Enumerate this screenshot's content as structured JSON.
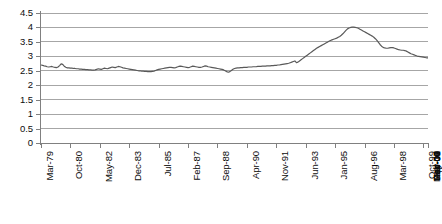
{
  "chart_data": {
    "type": "line",
    "title": "",
    "subtitle": "",
    "xlabel": "",
    "ylabel": "",
    "ylim": [
      0,
      4.5
    ],
    "grid": true,
    "legend": false,
    "legend_position": "none",
    "line_color": "#595959",
    "gridline_color": "#a6a6a6",
    "axis_color": "#808080",
    "text_color": "#0d0d0d",
    "y_ticks": [
      "0",
      "0.5",
      "1",
      "1.5",
      "2",
      "2.5",
      "3",
      "3.5",
      "4",
      "4.5"
    ],
    "y_tick_values": [
      0,
      0.5,
      1,
      1.5,
      2,
      2.5,
      3,
      3.5,
      4,
      4.5
    ],
    "x_tick_labels": [
      "Mar-79",
      "Oct-80",
      "May-82",
      "Dec-83",
      "Jul-85",
      "Feb-87",
      "Sep-88",
      "Apr-90",
      "Nov-91",
      "Jun-93",
      "Jan-95",
      "Aug-96",
      "Mar-98",
      "Oct-99",
      "May-01",
      "Dec-02",
      "Jul-04",
      "Feb-06",
      "Sep-07",
      "Apr-09",
      "Nov-10"
    ],
    "x_tick_interval_months": 19,
    "x_start": "Mar-79",
    "x_end": "Nov-10",
    "series": [
      {
        "name": "series-1",
        "color": "#595959",
        "values": [
          2.7,
          2.69,
          2.67,
          2.66,
          2.64,
          2.63,
          2.64,
          2.65,
          2.63,
          2.62,
          2.61,
          2.63,
          2.68,
          2.74,
          2.72,
          2.66,
          2.62,
          2.6,
          2.6,
          2.59,
          2.59,
          2.58,
          2.58,
          2.57,
          2.57,
          2.56,
          2.56,
          2.55,
          2.55,
          2.54,
          2.54,
          2.53,
          2.53,
          2.52,
          2.52,
          2.53,
          2.55,
          2.57,
          2.56,
          2.55,
          2.57,
          2.59,
          2.58,
          2.57,
          2.59,
          2.61,
          2.63,
          2.62,
          2.61,
          2.63,
          2.65,
          2.64,
          2.62,
          2.6,
          2.59,
          2.58,
          2.57,
          2.56,
          2.55,
          2.54,
          2.53,
          2.52,
          2.51,
          2.5,
          2.5,
          2.49,
          2.49,
          2.48,
          2.48,
          2.47,
          2.47,
          2.47,
          2.48,
          2.49,
          2.51,
          2.53,
          2.55,
          2.56,
          2.57,
          2.58,
          2.59,
          2.6,
          2.61,
          2.62,
          2.62,
          2.61,
          2.6,
          2.61,
          2.63,
          2.65,
          2.66,
          2.65,
          2.64,
          2.63,
          2.62,
          2.61,
          2.62,
          2.64,
          2.66,
          2.65,
          2.64,
          2.63,
          2.62,
          2.62,
          2.63,
          2.65,
          2.67,
          2.66,
          2.64,
          2.63,
          2.62,
          2.61,
          2.6,
          2.59,
          2.58,
          2.57,
          2.56,
          2.55,
          2.53,
          2.5,
          2.47,
          2.45,
          2.47,
          2.51,
          2.55,
          2.58,
          2.59,
          2.6,
          2.6,
          2.61,
          2.61,
          2.62,
          2.62,
          2.62,
          2.63,
          2.63,
          2.63,
          2.64,
          2.64,
          2.64,
          2.65,
          2.65,
          2.65,
          2.66,
          2.66,
          2.66,
          2.67,
          2.67,
          2.67,
          2.68,
          2.68,
          2.69,
          2.69,
          2.7,
          2.7,
          2.71,
          2.72,
          2.73,
          2.74,
          2.75,
          2.76,
          2.78,
          2.8,
          2.82,
          2.84,
          2.78,
          2.8,
          2.84,
          2.88,
          2.92,
          2.96,
          3.0,
          3.04,
          3.08,
          3.12,
          3.16,
          3.2,
          3.24,
          3.28,
          3.31,
          3.34,
          3.37,
          3.4,
          3.43,
          3.46,
          3.49,
          3.52,
          3.55,
          3.57,
          3.59,
          3.61,
          3.63,
          3.66,
          3.69,
          3.73,
          3.78,
          3.84,
          3.9,
          3.95,
          3.98,
          4.0,
          4.01,
          4.01,
          4.0,
          3.99,
          3.97,
          3.94,
          3.91,
          3.88,
          3.85,
          3.82,
          3.79,
          3.76,
          3.73,
          3.7,
          3.66,
          3.61,
          3.55,
          3.48,
          3.41,
          3.35,
          3.31,
          3.29,
          3.28,
          3.28,
          3.29,
          3.3,
          3.3,
          3.29,
          3.27,
          3.25,
          3.23,
          3.22,
          3.21,
          3.21,
          3.2,
          3.18,
          3.15,
          3.12,
          3.09,
          3.07,
          3.05,
          3.03,
          3.01,
          3.0,
          2.99,
          2.98,
          2.97,
          2.96,
          2.95,
          2.95
        ]
      }
    ]
  }
}
